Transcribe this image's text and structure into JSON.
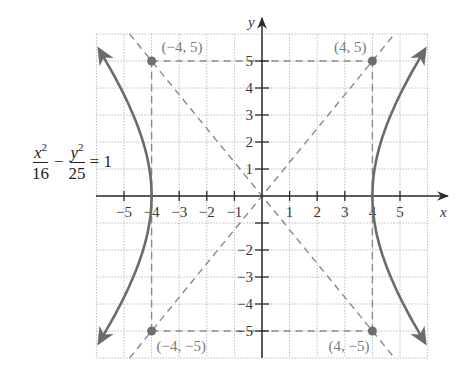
{
  "chart_data": {
    "type": "line",
    "title": "",
    "equation": "x^2/16 - y^2/25 = 1",
    "xlabel": "x",
    "ylabel": "y",
    "xlim": [
      -6,
      6
    ],
    "ylim": [
      -6,
      6
    ],
    "grid": true,
    "x_ticks": [
      -5,
      -4,
      -3,
      -2,
      -1,
      1,
      2,
      3,
      4,
      5
    ],
    "x_tick_labels": [
      "−5",
      "−4",
      "−3",
      "−2",
      "−1",
      "1",
      "2",
      "3",
      "4",
      "5"
    ],
    "y_ticks": [
      -5,
      -4,
      -3,
      -2,
      -1,
      1,
      2,
      3,
      4,
      5
    ],
    "y_tick_labels": [
      "−5",
      "−4",
      "−3",
      "−2",
      "",
      "1",
      "2",
      "3",
      "4",
      "5"
    ],
    "hyperbola": {
      "a": 4,
      "b": 5,
      "orientation": "horizontal",
      "vertices": [
        [
          -4,
          0
        ],
        [
          4,
          0
        ]
      ]
    },
    "asymptotes": [
      {
        "name": "y = 5/4 x",
        "slope": 1.25,
        "style": "dashed"
      },
      {
        "name": "y = -5/4 x",
        "slope": -1.25,
        "style": "dashed"
      }
    ],
    "fundamental_rectangle": {
      "x": [
        -4,
        4
      ],
      "y": [
        -5,
        5
      ],
      "style": "dashed"
    },
    "points": [
      {
        "x": -4,
        "y": 5,
        "label": "(−4, 5)"
      },
      {
        "x": 4,
        "y": 5,
        "label": "(4, 5)"
      },
      {
        "x": -4,
        "y": -5,
        "label": "(−4, −5)"
      },
      {
        "x": 4,
        "y": -5,
        "label": "(4, −5)"
      }
    ],
    "annotations": [
      {
        "text": "x²/16 − y²/25 = 1",
        "position": "left of left branch, near y=1"
      }
    ]
  },
  "equation": {
    "num1": "x",
    "exp1": "2",
    "den1": "16",
    "minus": "−",
    "num2": "y",
    "exp2": "2",
    "den2": "25",
    "equals": "= 1"
  },
  "colors": {
    "curve": "#6b6b6b",
    "axis": "#2b2b2b",
    "grid": "#bdbdbd",
    "dashed": "#8a8a8a",
    "point": "#6e6e6e",
    "point_label": "#7a7a7a"
  },
  "layout": {
    "origin_px": [
      262,
      196
    ],
    "unit_x_px": 27.6,
    "unit_y_px": 27.0,
    "x_axis_span_px": [
      96,
      448
    ],
    "y_axis_span_px": [
      358,
      18
    ]
  }
}
